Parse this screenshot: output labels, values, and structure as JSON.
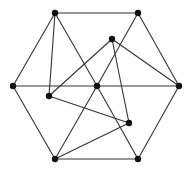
{
  "diagram": {
    "type": "graph",
    "nodes": [
      {
        "id": "top-left",
        "x": 55,
        "y": 13
      },
      {
        "id": "top-right",
        "x": 138,
        "y": 13
      },
      {
        "id": "left",
        "x": 13,
        "y": 86
      },
      {
        "id": "center",
        "x": 97,
        "y": 86
      },
      {
        "id": "right",
        "x": 179,
        "y": 86
      },
      {
        "id": "bottom-left",
        "x": 55,
        "y": 159
      },
      {
        "id": "bottom-right",
        "x": 138,
        "y": 159
      },
      {
        "id": "inner-top",
        "x": 112,
        "y": 39
      },
      {
        "id": "inner-left",
        "x": 49,
        "y": 96
      },
      {
        "id": "inner-bottom-right",
        "x": 129,
        "y": 123
      }
    ],
    "edges": [
      [
        "top-left",
        "top-right"
      ],
      [
        "top-left",
        "left"
      ],
      [
        "top-left",
        "inner-left"
      ],
      [
        "top-left",
        "center"
      ],
      [
        "center",
        "bottom-right"
      ],
      [
        "top-right",
        "right"
      ],
      [
        "top-right",
        "center"
      ],
      [
        "center",
        "bottom-left"
      ],
      [
        "left",
        "center"
      ],
      [
        "center",
        "right"
      ],
      [
        "left",
        "bottom-left"
      ],
      [
        "right",
        "bottom-right"
      ],
      [
        "bottom-left",
        "bottom-right"
      ],
      [
        "inner-top",
        "inner-left"
      ],
      [
        "inner-top",
        "right"
      ],
      [
        "inner-top",
        "inner-bottom-right"
      ],
      [
        "inner-left",
        "inner-bottom-right"
      ],
      [
        "bottom-left",
        "inner-bottom-right"
      ]
    ]
  }
}
